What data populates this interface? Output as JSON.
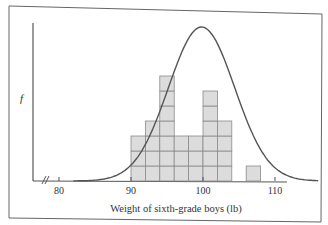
{
  "chart_data": {
    "type": "bar",
    "subtype": "histogram with fitted normal curve",
    "title": "",
    "xlabel": "Weight of sixth-grade boys (lb)",
    "ylabel": "f",
    "xlim": [
      77,
      115
    ],
    "x_ticks": [
      80,
      90,
      100,
      110
    ],
    "x_tick_labels": [
      "80",
      "90",
      "100",
      "110"
    ],
    "axis_break": true,
    "bin_width": 2,
    "categories": [
      "90-92",
      "92-94",
      "94-96",
      "96-98",
      "98-100",
      "100-102",
      "102-104",
      "104-106",
      "106-108"
    ],
    "bins": [
      {
        "start": 90,
        "end": 92,
        "count": 3
      },
      {
        "start": 92,
        "end": 94,
        "count": 4
      },
      {
        "start": 94,
        "end": 96,
        "count": 7
      },
      {
        "start": 96,
        "end": 98,
        "count": 3
      },
      {
        "start": 98,
        "end": 100,
        "count": 3
      },
      {
        "start": 100,
        "end": 102,
        "count": 6
      },
      {
        "start": 102,
        "end": 104,
        "count": 4
      },
      {
        "start": 104,
        "end": 106,
        "count": 0
      },
      {
        "start": 106,
        "end": 108,
        "count": 1
      }
    ],
    "values": [
      3,
      4,
      7,
      3,
      3,
      6,
      4,
      0,
      1
    ],
    "series": [
      {
        "name": "Histogram",
        "values": [
          3,
          4,
          7,
          3,
          3,
          6,
          4,
          0,
          1
        ]
      },
      {
        "name": "Normal curve",
        "mean": 100,
        "peak_relative": 10.3
      }
    ],
    "grid": false,
    "legend": null,
    "colors": {
      "bar_fill": "#dcdcdc",
      "bar_stroke": "#8a8a8a",
      "curve": "#555555",
      "axis": "#555555",
      "frame": "#555555"
    }
  }
}
